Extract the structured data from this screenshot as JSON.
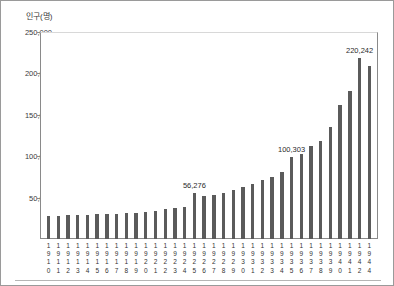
{
  "chart_data": {
    "type": "bar",
    "title": "",
    "subtitle": "",
    "xlabel": "",
    "ylabel": "인구(명)",
    "ylim": [
      0,
      250000
    ],
    "yticks": [
      50000,
      100000,
      150000,
      200000,
      250000
    ],
    "ytick_labels": [
      "50,000",
      "100,000",
      "150,000",
      "200,000",
      "250,000"
    ],
    "grid": false,
    "legend": null,
    "bar_color": "#5b5b5b",
    "categories": [
      "1910",
      "1911",
      "1912",
      "1913",
      "1914",
      "1915",
      "1916",
      "1917",
      "1918",
      "1919",
      "1920",
      "1921",
      "1922",
      "1923",
      "1924",
      "1925",
      "1926",
      "1927",
      "1928",
      "1929",
      "1930",
      "1931",
      "1932",
      "1933",
      "1934",
      "1935",
      "1936",
      "1937",
      "1938",
      "1939",
      "1940",
      "1941",
      "1942",
      "1944"
    ],
    "values": [
      28000,
      28500,
      28800,
      29000,
      29500,
      30000,
      30500,
      31000,
      31500,
      32000,
      33000,
      34500,
      36000,
      37500,
      39000,
      56276,
      52500,
      54000,
      56500,
      60000,
      64000,
      67500,
      72000,
      76000,
      82000,
      100303,
      104000,
      113000,
      120000,
      136000,
      163000,
      181000,
      220242,
      211000
    ],
    "annotations": [
      {
        "category": "1925",
        "value": 56276,
        "text": "56,276"
      },
      {
        "category": "1935",
        "value": 100303,
        "text": "100,303"
      },
      {
        "category": "1942",
        "value": 220242,
        "text": "220,242"
      }
    ]
  }
}
